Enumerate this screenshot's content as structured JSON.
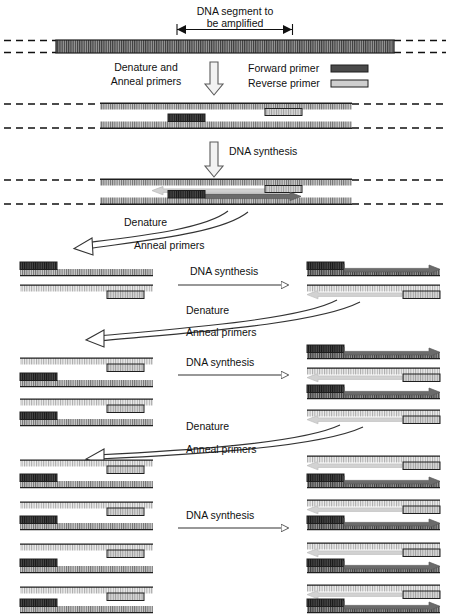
{
  "figure": {
    "width": 450,
    "height": 616
  },
  "colors": {
    "forward_primer": "#4a4a4a",
    "reverse_primer": "#c9c9c9",
    "template_strand": "#5a5a5a",
    "new_strand_dark": "#585858",
    "new_strand_light": "#cfcfcf",
    "line": "#222222",
    "text": "#111111"
  },
  "labels": {
    "segment_line1": "DNA segment to",
    "segment_line2": "be amplified",
    "denature_and": "Denature and",
    "anneal_primers_1": "Anneal primers",
    "forward_primer": "Forward primer",
    "reverse_primer": "Reverse primer",
    "dna_synthesis_1": "DNA synthesis",
    "denature_2": "Denature",
    "anneal_primers_2": "Anneal primers",
    "dna_synthesis_2": "DNA synthesis",
    "denature_3": "Denature",
    "anneal_primers_3": "Anneal primers",
    "dna_synthesis_3": "DNA synthesis",
    "denature_4": "Denature",
    "anneal_primers_4": "Anneal primers",
    "dna_synthesis_4": "DNA synthesis"
  },
  "legend": [
    {
      "name": "forward-primer",
      "label": "Forward primer",
      "swatch": "#4a4a4a"
    },
    {
      "name": "reverse-primer",
      "label": "Reverse primer",
      "swatch": "#c9c9c9"
    }
  ],
  "stages": [
    {
      "id": "genomic-dna",
      "caption": "Double-stranded genomic DNA with the segment to be amplified marked"
    },
    {
      "id": "denature-anneal-1",
      "caption": "Denature and Anneal primers"
    },
    {
      "id": "synthesis-1",
      "caption": "DNA synthesis extends from each primer"
    },
    {
      "id": "cycle-2",
      "caption": "Denature, Anneal primers, DNA synthesis — 2 duplexes"
    },
    {
      "id": "cycle-3",
      "caption": "Denature, Anneal primers, DNA synthesis — 4 duplexes"
    },
    {
      "id": "cycle-4",
      "caption": "Denature, Anneal primers, DNA synthesis — 8 duplexes"
    }
  ],
  "measurements": {
    "amplified_segment_start_x": 177,
    "amplified_segment_end_x": 292,
    "strand_height": 7
  }
}
